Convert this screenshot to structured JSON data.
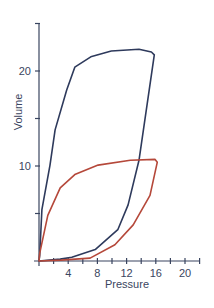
{
  "chart_data": {
    "type": "line",
    "title": "",
    "xlabel": "Pressure",
    "ylabel": "Volume",
    "xlim": [
      0,
      22
    ],
    "ylim": [
      0,
      25
    ],
    "xticks": [
      4,
      8,
      12,
      16,
      20
    ],
    "xminor_ticks": [
      2,
      6,
      10,
      14,
      18,
      22
    ],
    "yticks": [
      10,
      20
    ],
    "yminor_ticks": [
      5,
      15,
      25
    ],
    "grid": false,
    "legend": null,
    "series": [
      {
        "name": "blue-loop",
        "color": "#2e3a5c",
        "inflation": [
          [
            0,
            0
          ],
          [
            0.1,
            0.6
          ],
          [
            0.4,
            5.4
          ],
          [
            1.5,
            10.1
          ],
          [
            2.2,
            13.8
          ],
          [
            3.8,
            18.0
          ],
          [
            4.9,
            20.4
          ],
          [
            7.1,
            21.5
          ],
          [
            9.9,
            22.1
          ],
          [
            13.7,
            22.3
          ],
          [
            15.4,
            22.0
          ],
          [
            15.8,
            21.7
          ]
        ],
        "deflation": [
          [
            15.8,
            21.7
          ],
          [
            13.7,
            10.6
          ],
          [
            12.2,
            5.9
          ],
          [
            10.8,
            3.3
          ],
          [
            7.7,
            1.2
          ],
          [
            4.5,
            0.4
          ],
          [
            2.9,
            0.2
          ],
          [
            0,
            0
          ]
        ]
      },
      {
        "name": "red-loop",
        "color": "#b5483a",
        "inflation": [
          [
            0,
            0
          ],
          [
            0.1,
            0.8
          ],
          [
            1.2,
            4.8
          ],
          [
            2.9,
            7.7
          ],
          [
            4.9,
            9.1
          ],
          [
            8.1,
            10.1
          ],
          [
            12.5,
            10.6
          ],
          [
            15.9,
            10.7
          ],
          [
            16.2,
            10.4
          ]
        ],
        "deflation": [
          [
            16.2,
            10.4
          ],
          [
            15.2,
            6.9
          ],
          [
            12.9,
            3.8
          ],
          [
            10.4,
            1.7
          ],
          [
            7.0,
            0.3
          ],
          [
            3.0,
            0.1
          ],
          [
            0,
            0
          ]
        ]
      }
    ]
  },
  "labels": {
    "x_title": "Pressure",
    "y_title": "Volume",
    "x_ticks": [
      "4",
      "8",
      "12",
      "16",
      "20"
    ],
    "y_ticks": [
      "10",
      "20"
    ]
  },
  "colors": {
    "axis": "#3a4560",
    "blue": "#2e3a5c",
    "red": "#b5483a"
  }
}
